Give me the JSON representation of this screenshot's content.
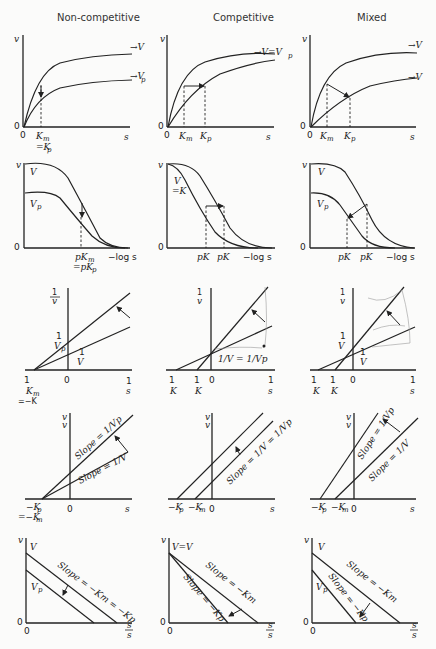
{
  "figure": {
    "columns": [
      {
        "label": "Non-competitive"
      },
      {
        "label": "Competitive"
      },
      {
        "label": "Mixed"
      }
    ],
    "rows": [
      {
        "plot": "v vs s (Michaelis-Menten)",
        "panels": [
          {
            "y_axis": "v",
            "x_axis": "s",
            "origin": "0",
            "y_origin": "0",
            "curve_labels": [
              "→V",
              "→Vp"
            ],
            "x_marks": [
              "Km",
              "=Kp"
            ]
          },
          {
            "y_axis": "v",
            "x_axis": "s",
            "origin": "0",
            "y_origin": "0",
            "curve_labels": [
              "→V=Vp"
            ],
            "x_marks": [
              "Km",
              "Kp"
            ]
          },
          {
            "y_axis": "v",
            "x_axis": "s",
            "origin": "0",
            "y_origin": "0",
            "curve_labels": [
              "→V",
              "→Vp"
            ],
            "x_marks": [
              "Km",
              "Kp"
            ]
          }
        ]
      },
      {
        "plot": "v vs -log s",
        "panels": [
          {
            "y_axis": "v",
            "x_axis": "−log s",
            "origin": "0",
            "curve_labels": [
              "V",
              "Vp"
            ],
            "x_marks": [
              "pKm",
              "=pKp"
            ]
          },
          {
            "y_axis": "v",
            "x_axis": "−log s",
            "origin": "0",
            "curve_labels": [
              "V",
              "=Vp"
            ],
            "x_marks": [
              "pKp",
              "pKm"
            ]
          },
          {
            "y_axis": "v",
            "x_axis": "−log s",
            "origin": "0",
            "curve_labels": [
              "V",
              "Vp"
            ],
            "x_marks": [
              "pKp",
              "pKm"
            ]
          }
        ]
      },
      {
        "plot": "1/v vs 1/s (Lineweaver-Burk)",
        "panels": [
          {
            "y_axis": "1/v",
            "x_axis": "1/s",
            "origin": "0",
            "intercept_labels": [
              "1/Vp",
              "1/V"
            ],
            "x_marks": [
              "−1/Km",
              "=−1/Kp"
            ]
          },
          {
            "y_axis": "1/v",
            "x_axis": "1/s",
            "origin": "0",
            "intercept_labels": [
              "1/V = 1/Vp"
            ],
            "x_marks": [
              "−1/Km",
              "−1/Kp"
            ]
          },
          {
            "y_axis": "1/v",
            "x_axis": "1/s",
            "origin": "0",
            "intercept_labels": [
              "1/Vp",
              "1/V"
            ],
            "x_marks": [
              "−1/Km",
              "−1/Kp"
            ]
          }
        ]
      },
      {
        "plot": "s/v vs s (Hanes)",
        "panels": [
          {
            "y_axis": "s/v",
            "x_axis": "s",
            "origin": "0",
            "slope_labels": [
              "Slope = 1/Vp",
              "Slope = 1/V"
            ],
            "x_marks": [
              "−Kp",
              "=−Km"
            ]
          },
          {
            "y_axis": "s/v",
            "x_axis": "s",
            "origin": "0",
            "slope_labels": [
              "Slope = 1/V = 1/Vp"
            ],
            "x_marks": [
              "−Kp",
              "−Km"
            ]
          },
          {
            "y_axis": "s/v",
            "x_axis": "s",
            "origin": "0",
            "slope_labels": [
              "Slope = 1/Vp",
              "Slope = 1/V"
            ],
            "x_marks": [
              "−Kp",
              "−Km"
            ]
          }
        ]
      },
      {
        "plot": "v vs v/s (Eadie-Hofstee)",
        "panels": [
          {
            "y_axis": "v",
            "x_axis": "v/s",
            "origin": "0",
            "y_origin": "0",
            "intercept_labels": [
              "V",
              "Vp"
            ],
            "slope_labels": [
              "Slope = −Km = −Kp"
            ]
          },
          {
            "y_axis": "v",
            "x_axis": "v/s",
            "origin": "0",
            "y_origin": "0",
            "intercept_labels": [
              "V=Vp"
            ],
            "slope_labels": [
              "Slope = −Km",
              "Slope = −Kp"
            ]
          },
          {
            "y_axis": "v",
            "x_axis": "v/s",
            "origin": "0",
            "y_origin": "0",
            "intercept_labels": [
              "V",
              "Vp"
            ],
            "slope_labels": [
              "Slope = −Km",
              "Slope = −Kp"
            ]
          }
        ]
      }
    ]
  },
  "labels": {
    "v": "v",
    "s": "s",
    "zero": "0",
    "mlogs": "−log s",
    "one": "1",
    "V": "V",
    "Vp": "Vp",
    "Km": "K",
    "m": "m",
    "p": "p",
    "arrowV": "→V",
    "arrowVp": "→V",
    "VeqVp": "→V=V",
    "eqKp": "=K",
    "pK": "pK",
    "eqpK": "=pK",
    "slope": "Slope",
    "c1_r4_s1": "Slope = 1/Vp",
    "c1_r4_s2": "Slope = 1/V",
    "c2_r4_s1": "Slope = 1/V = 1/Vp",
    "c3_r4_s1": "Slope = 1/Vp",
    "c3_r4_s2": "Slope = 1/V",
    "c1_r5_s1": "Slope = −Km = −Kp",
    "c2_r5_s1": "Slope = −Km",
    "c2_r5_s2": "Slope = −Kp",
    "c3_r5_s1": "Slope = −Km",
    "c3_r5_s2": "Slope = −Kp",
    "c2_r3_int": "1/V = 1/Vp",
    "mKp": "−K",
    "mKm": "−K",
    "eqmKm": "=−K",
    "VeqVp5": "V=V",
    "vs_top": "v",
    "vs_bot": "s",
    "sv_top": "s",
    "sv_bot": "v"
  }
}
